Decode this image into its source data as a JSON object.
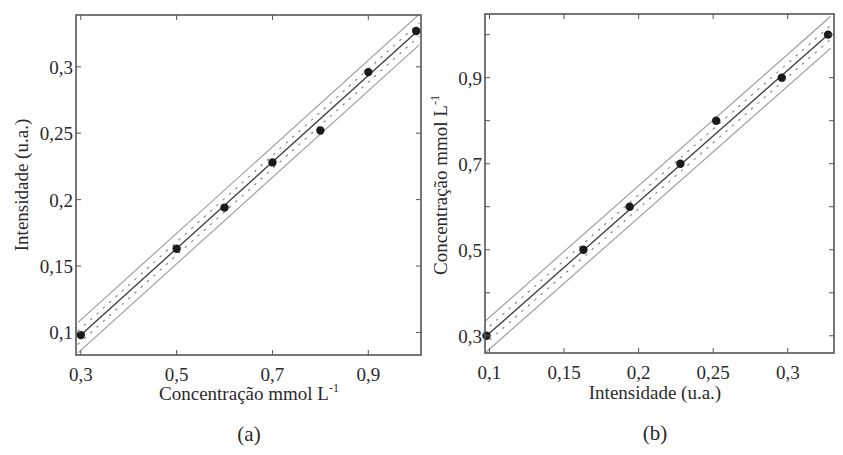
{
  "chart_data": [
    {
      "type": "scatter",
      "panel_label": "(a)",
      "title": "",
      "xlabel": "Concentração mmol L",
      "xlabel_superscript": "-1",
      "ylabel": "Intensidade (u.a.)",
      "xlim": [
        0.29,
        1.01
      ],
      "ylim": [
        0.083,
        0.339
      ],
      "xticks": [
        0.3,
        0.5,
        0.7,
        0.9
      ],
      "xtick_labels": [
        "0,3",
        "0,5",
        "0,7",
        "0,9"
      ],
      "yticks": [
        0.1,
        0.15,
        0.2,
        0.25,
        0.3
      ],
      "ytick_labels": [
        "0,1",
        "0,15",
        "0,2",
        "0,25",
        "0,3"
      ],
      "grid": false,
      "legend": null,
      "series": [
        {
          "name": "Dados experimentais",
          "kind": "points",
          "x": [
            0.3,
            0.5,
            0.6,
            0.7,
            0.8,
            0.9,
            1.0
          ],
          "y": [
            0.098,
            0.163,
            0.194,
            0.228,
            0.252,
            0.296,
            0.327
          ]
        },
        {
          "name": "Ajuste linear",
          "kind": "line",
          "x": [
            0.3,
            1.0
          ],
          "y": [
            0.098,
            0.326
          ]
        },
        {
          "name": "Banda interna (pontilhada)",
          "kind": "band-dotted",
          "offset": 0.005
        },
        {
          "name": "Banda externa",
          "kind": "band-solid",
          "offset": 0.0115
        }
      ]
    },
    {
      "type": "scatter",
      "panel_label": "(b)",
      "title": "",
      "xlabel": "Intensidade (u.a.)",
      "ylabel": "Concentração mmol L",
      "ylabel_superscript": "-1",
      "xlim": [
        0.097,
        0.331
      ],
      "ylim": [
        0.26,
        1.048
      ],
      "xticks": [
        0.1,
        0.15,
        0.2,
        0.25,
        0.3
      ],
      "xtick_labels": [
        "0,1",
        "0,15",
        "0,2",
        "0,25",
        "0,3"
      ],
      "yticks": [
        0.3,
        0.5,
        0.7,
        0.9
      ],
      "ytick_labels": [
        "0,3",
        "0,5",
        "0,7",
        "0,9"
      ],
      "yminor_ticks": [
        0.4,
        0.6,
        0.8,
        1.0
      ],
      "grid": false,
      "legend": null,
      "series": [
        {
          "name": "Dados experimentais",
          "kind": "points",
          "x": [
            0.098,
            0.163,
            0.194,
            0.228,
            0.252,
            0.296,
            0.327
          ],
          "y": [
            0.3,
            0.5,
            0.6,
            0.7,
            0.8,
            0.9,
            1.0
          ]
        },
        {
          "name": "Ajuste linear",
          "kind": "line",
          "x": [
            0.098,
            0.327
          ],
          "y": [
            0.3,
            1.0
          ]
        },
        {
          "name": "Banda interna (pontilhada)",
          "kind": "band-dotted",
          "offset": 0.016
        },
        {
          "name": "Banda externa",
          "kind": "band-solid",
          "offset": 0.037
        }
      ]
    }
  ],
  "layout": {
    "panels": [
      {
        "box": {
          "left": 76,
          "top": 15,
          "right": 421,
          "bottom": 355
        },
        "xlabel_pos": [
          249,
          400
        ],
        "ylabel_pos": [
          28,
          185
        ],
        "panel_label_pos": [
          249,
          441
        ]
      },
      {
        "box": {
          "left": 485,
          "top": 14,
          "right": 834,
          "bottom": 353
        },
        "xlabel_pos": [
          655,
          399
        ],
        "ylabel_pos": [
          447,
          185
        ],
        "panel_label_pos": [
          655,
          440
        ]
      }
    ],
    "colors": {
      "axis": "#555555",
      "line": "#3a3a3a",
      "band_solid": "#9a9a9a",
      "band_dotted": "#8a8a8a",
      "points": "#1a1a1a",
      "text": "#2a2a2a"
    }
  }
}
